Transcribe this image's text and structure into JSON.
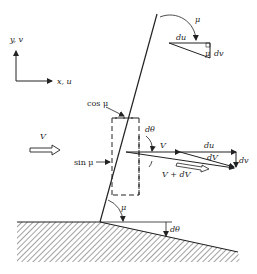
{
  "diagram": {
    "axes": {
      "y_label": "y, v",
      "x_label": "x, u"
    },
    "freestream": {
      "label": "V"
    },
    "dashed_box": {
      "top_label": "cos μ",
      "side_label": "sin μ"
    },
    "angles": {
      "mu_top": "μ",
      "mu_triangle": "μ",
      "mu_bottom": "μ",
      "dtheta_box": "dθ",
      "dtheta_wall": "dθ"
    },
    "upper_triangle": {
      "du": "du",
      "dv": "dv"
    },
    "vectors": {
      "v": "V",
      "du": "du",
      "dV": "dV",
      "v_plus_dv": "V + dV",
      "dv": "dv"
    },
    "colors": {
      "ink": "#222222",
      "background": "#ffffff"
    }
  }
}
